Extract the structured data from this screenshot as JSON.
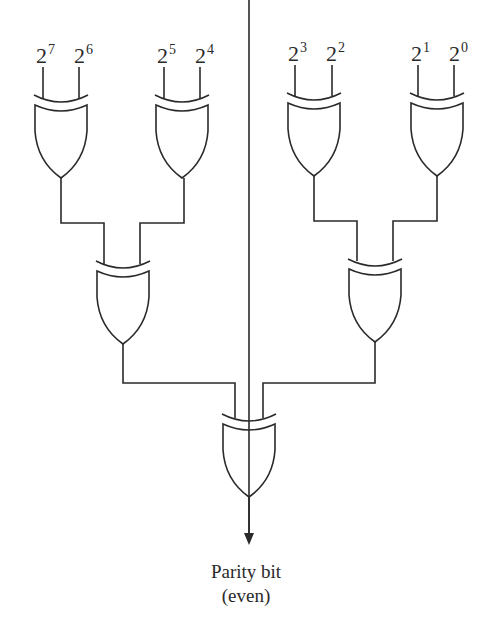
{
  "diagram": {
    "inputs": [
      {
        "base": "2",
        "exp": "7"
      },
      {
        "base": "2",
        "exp": "6"
      },
      {
        "base": "2",
        "exp": "5"
      },
      {
        "base": "2",
        "exp": "4"
      },
      {
        "base": "2",
        "exp": "3"
      },
      {
        "base": "2",
        "exp": "2"
      },
      {
        "base": "2",
        "exp": "1"
      },
      {
        "base": "2",
        "exp": "0"
      }
    ],
    "gates": {
      "level1": [
        "XOR(2^7,2^6)",
        "XOR(2^5,2^4)",
        "XOR(2^3,2^2)",
        "XOR(2^1,2^0)"
      ],
      "level2": [
        "XOR(left pair)",
        "XOR(right pair)"
      ],
      "level3": [
        "XOR(final)"
      ]
    },
    "output": {
      "line1": "Parity bit",
      "line2": "(even)"
    },
    "colors": {
      "stroke": "#2a2a2a",
      "background": "#ffffff"
    }
  }
}
